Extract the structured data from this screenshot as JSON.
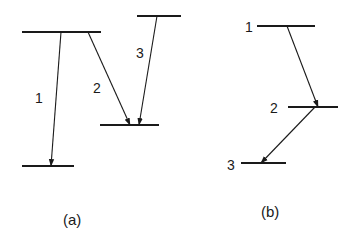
{
  "colors": {
    "ink": "#1a1a1a",
    "background": "#ffffff"
  },
  "panels": [
    {
      "id": "a",
      "caption": "(a)",
      "levels": [
        {
          "id": "upper-left",
          "x1": 22,
          "x2": 101,
          "y": 32
        },
        {
          "id": "upper-right",
          "x1": 137,
          "x2": 181,
          "y": 16
        },
        {
          "id": "middle",
          "x1": 100,
          "x2": 159,
          "y": 125
        },
        {
          "id": "bottom",
          "x1": 22,
          "x2": 74,
          "y": 166
        }
      ],
      "transitions": [
        {
          "label": "1",
          "from": [
            61,
            32
          ],
          "to": [
            51,
            166
          ],
          "label_pos": [
            35,
            103
          ]
        },
        {
          "label": "2",
          "from": [
            88,
            32
          ],
          "to": [
            130,
            125
          ],
          "label_pos": [
            93,
            93
          ]
        },
        {
          "label": "3",
          "from": [
            157,
            16
          ],
          "to": [
            139,
            125
          ],
          "label_pos": [
            136,
            58
          ]
        }
      ],
      "caption_pos": [
        63,
        225
      ]
    },
    {
      "id": "b",
      "caption": "(b)",
      "levels": [
        {
          "id": "level-1",
          "label": "1",
          "x1": 257,
          "x2": 315,
          "y": 26
        },
        {
          "id": "level-2",
          "label": "2",
          "x1": 288,
          "x2": 338,
          "y": 107
        },
        {
          "id": "level-3",
          "label": "3",
          "x1": 241,
          "x2": 286,
          "y": 163
        }
      ],
      "level_labels": [
        {
          "text": "1",
          "pos": [
            245,
            32
          ]
        },
        {
          "text": "2",
          "pos": [
            270,
            113
          ]
        },
        {
          "text": "3",
          "pos": [
            227,
            170
          ]
        }
      ],
      "transitions": [
        {
          "from": [
            287,
            26
          ],
          "to": [
            318,
            107
          ]
        },
        {
          "from": [
            315,
            107
          ],
          "to": [
            261,
            163
          ]
        }
      ],
      "caption_pos": [
        261,
        217
      ]
    }
  ]
}
